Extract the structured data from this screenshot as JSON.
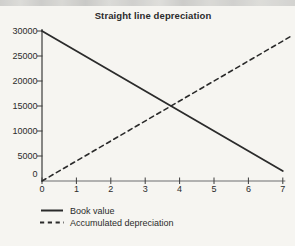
{
  "figure": {
    "background_color": "#f6f5f1",
    "ink_color": "#2b2b2b",
    "x_axis_color": "#9a9a9a",
    "y_axis_color": "#4a4a4a",
    "tick_color": "#3d3d3d"
  },
  "chart_data": {
    "type": "line",
    "title": "Straight line depreciation",
    "xlabel": "",
    "ylabel": "",
    "xlim": [
      0,
      7
    ],
    "ylim": [
      0,
      30000
    ],
    "grid": false,
    "legend_position": "bottom-left",
    "x": [
      0,
      1,
      2,
      3,
      4,
      5,
      6,
      7
    ],
    "x_tick_labels": [
      "0",
      "1",
      "2",
      "3",
      "4",
      "5",
      "6",
      "7"
    ],
    "y_ticks": [
      0,
      5000,
      10000,
      15000,
      20000,
      25000,
      30000
    ],
    "y_tick_labels": [
      "0",
      "5000",
      "10000",
      "15000",
      "20000",
      "25000",
      "30000"
    ],
    "series": [
      {
        "name": "Book value",
        "line_style": "solid",
        "color": "#2b2b2b",
        "values": [
          30000,
          26000,
          22000,
          18000,
          14000,
          10000,
          6000,
          2000
        ]
      },
      {
        "name": "Accumulated depreciation",
        "line_style": "dashed",
        "color": "#2b2b2b",
        "values": [
          0,
          4000,
          8000,
          12000,
          16000,
          20000,
          24000,
          28000
        ]
      }
    ]
  }
}
